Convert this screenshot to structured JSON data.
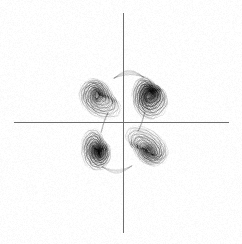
{
  "figure": {
    "title": "",
    "background_color": "#ffffff",
    "width": 242,
    "height": 244,
    "render_style": "scanned-grayscale-line-plot",
    "ink_color": "#1a1a1a",
    "axis_color": "#6e6e6e"
  },
  "axes": {
    "x_axis": {
      "name": "horizontal-axis",
      "label": "",
      "y_pixel": 122,
      "x_start_pixel": 14,
      "x_end_pixel": 229,
      "ticks": [],
      "tick_labels": []
    },
    "y_axis": {
      "name": "vertical-axis",
      "label": "",
      "x_pixel": 123,
      "y_start_pixel": 13,
      "y_end_pixel": 233,
      "ticks": [],
      "tick_labels": []
    },
    "origin_pixel": [
      123,
      122
    ],
    "grid": false,
    "frame": false
  },
  "chart_data": {
    "type": "line",
    "title": "",
    "subtitle": "",
    "xlabel": "",
    "ylabel": "",
    "xlim": [
      -1.15,
      1.1
    ],
    "ylim": [
      -1.1,
      1.1
    ],
    "grid": false,
    "legend": false,
    "legend_entries": [],
    "annotations": [],
    "series": [
      {
        "name": "trajectory",
        "color": "#1a1a1a",
        "line_width": 0.35,
        "point_count": 52000,
        "closed": false
      }
    ],
    "lobes": [
      {
        "name": "upper-left-scroll",
        "quadrant": "II",
        "center": [
          -0.42,
          0.46
        ],
        "core": [
          -0.52,
          0.55
        ],
        "rx": 0.5,
        "ry": 0.36,
        "rotation_deg": -28,
        "turns": 26,
        "density": "medium",
        "darkness": 0.62
      },
      {
        "name": "upper-right-scroll",
        "quadrant": "I",
        "center": [
          0.56,
          0.52
        ],
        "core": [
          0.55,
          0.56
        ],
        "rx": 0.36,
        "ry": 0.45,
        "rotation_deg": 8,
        "turns": 24,
        "density": "high",
        "darkness": 0.95
      },
      {
        "name": "lower-left-scroll",
        "quadrant": "III",
        "center": [
          -0.53,
          -0.52
        ],
        "core": [
          -0.52,
          -0.58
        ],
        "rx": 0.33,
        "ry": 0.44,
        "rotation_deg": -8,
        "turns": 24,
        "density": "high",
        "darkness": 0.9
      },
      {
        "name": "lower-right-scroll",
        "quadrant": "IV",
        "center": [
          0.43,
          -0.47
        ],
        "core": [
          0.52,
          -0.56
        ],
        "rx": 0.5,
        "ry": 0.36,
        "rotation_deg": 152,
        "turns": 26,
        "density": "medium",
        "darkness": 0.66
      }
    ],
    "connectors": [
      {
        "name": "top-arc",
        "from": [
          -0.18,
          0.86
        ],
        "to": [
          0.42,
          0.88
        ],
        "sag": 0.1,
        "strands": 5
      },
      {
        "name": "bottom-arc",
        "from": [
          -0.42,
          -0.88
        ],
        "to": [
          0.18,
          -0.86
        ],
        "sag": -0.1,
        "strands": 4
      },
      {
        "name": "left-waist",
        "from": [
          -0.3,
          0.18
        ],
        "to": [
          -0.44,
          -0.2
        ],
        "sag": 0.05,
        "strands": 3
      },
      {
        "name": "right-waist",
        "from": [
          0.44,
          0.2
        ],
        "to": [
          0.3,
          -0.18
        ],
        "sag": -0.05,
        "strands": 3
      }
    ]
  }
}
